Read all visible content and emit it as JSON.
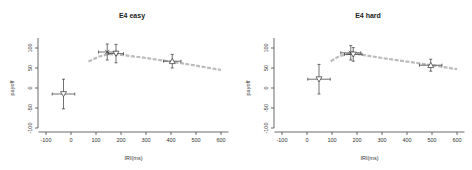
{
  "header": {
    "clipped_text": "▔▔▔ ▔▔▔▔▔▔ ▔▔ ▔▔▔▔▔▔▔ ▔▔▔▔▔ ▔▔▔▔▔▔ ▔▔▔▔ ▔▔▔▔▔"
  },
  "chart_data": [
    {
      "type": "scatter",
      "title": "E4 easy",
      "xlabel": "IRI(ms)",
      "ylabel": "payoff",
      "xlim": [
        -130,
        630
      ],
      "ylim": [
        -110,
        140
      ],
      "xticks": [
        -100,
        0,
        100,
        200,
        300,
        400,
        500,
        600
      ],
      "yticks": [
        -100,
        -50,
        0,
        50,
        100
      ],
      "grid": false,
      "points": [
        {
          "marker": "triangle-down",
          "x": -30,
          "y": -15,
          "xerr": 45,
          "yerr": 37
        },
        {
          "marker": "x",
          "x": 145,
          "y": 90,
          "xerr": 35,
          "yerr": 20
        },
        {
          "marker": "triangle-down",
          "x": 180,
          "y": 86,
          "xerr": 30,
          "yerr": 23
        },
        {
          "marker": "triangle-up",
          "x": 405,
          "y": 67,
          "xerr": 35,
          "yerr": 17
        }
      ],
      "fit_curve": {
        "color": "#bbbbbb",
        "style": "dashed-thick",
        "x": [
          70,
          110,
          150,
          200,
          300,
          400,
          500,
          600
        ],
        "y": [
          66,
          78,
          85,
          83,
          75,
          66,
          56,
          45
        ]
      }
    },
    {
      "type": "scatter",
      "title": "E4 hard",
      "xlabel": "IRI(ms)",
      "ylabel": "payoff",
      "xlim": [
        -130,
        630
      ],
      "ylim": [
        -110,
        140
      ],
      "xticks": [
        -100,
        0,
        100,
        200,
        300,
        400,
        500,
        600
      ],
      "yticks": [
        -100,
        -50,
        0,
        50,
        100
      ],
      "grid": false,
      "points": [
        {
          "marker": "triangle-down",
          "x": 48,
          "y": 22,
          "xerr": 45,
          "yerr": 37
        },
        {
          "marker": "x",
          "x": 175,
          "y": 88,
          "xerr": 40,
          "yerr": 18
        },
        {
          "marker": "triangle-down",
          "x": 185,
          "y": 84,
          "xerr": 35,
          "yerr": 17
        },
        {
          "marker": "triangle-up",
          "x": 495,
          "y": 57,
          "xerr": 45,
          "yerr": 15
        }
      ],
      "fit_curve": {
        "color": "#bbbbbb",
        "style": "dashed-thick",
        "x": [
          95,
          130,
          170,
          200,
          300,
          400,
          500,
          600
        ],
        "y": [
          67,
          80,
          86,
          85,
          75,
          66,
          57,
          47
        ]
      }
    }
  ]
}
